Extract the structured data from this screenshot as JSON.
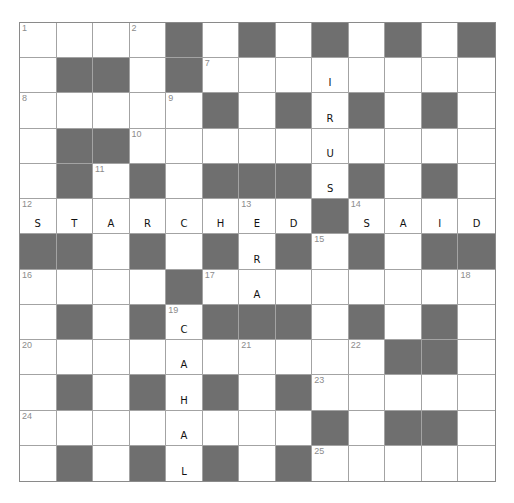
{
  "puzzle": {
    "rows": 13,
    "cols": 13,
    "colors": {
      "block": "#6f6f6f",
      "open": "#ffffff",
      "gridline": "#a3a3a3",
      "number": "#8c8c8c",
      "letter": "#111111"
    },
    "layout": [
      "....#.#.#.#.#",
      ".##.#........",
      ".....#.#.#.#.",
      ".##..........",
      ".#.#.###.#.#.",
      "........#....",
      "##.#.#.#.#.##",
      "....#........",
      ".#.#.###.#.#.",
      "..........##.",
      ".#.#.#.#.....",
      "........#.##.",
      ".#.#.#.#....."
    ],
    "numbers": [
      {
        "r": 0,
        "c": 0,
        "n": "1"
      },
      {
        "r": 0,
        "c": 3,
        "n": "2"
      },
      {
        "r": 0,
        "c": 6,
        "n": "3"
      },
      {
        "r": 0,
        "c": 8,
        "n": "4"
      },
      {
        "r": 0,
        "c": 10,
        "n": "5"
      },
      {
        "r": 0,
        "c": 12,
        "n": "6"
      },
      {
        "r": 1,
        "c": 5,
        "n": "7"
      },
      {
        "r": 2,
        "c": 0,
        "n": "8"
      },
      {
        "r": 2,
        "c": 4,
        "n": "9"
      },
      {
        "r": 3,
        "c": 3,
        "n": "10"
      },
      {
        "r": 4,
        "c": 2,
        "n": "11"
      },
      {
        "r": 5,
        "c": 0,
        "n": "12"
      },
      {
        "r": 5,
        "c": 6,
        "n": "13"
      },
      {
        "r": 5,
        "c": 9,
        "n": "14"
      },
      {
        "r": 6,
        "c": 8,
        "n": "15"
      },
      {
        "r": 7,
        "c": 0,
        "n": "16"
      },
      {
        "r": 7,
        "c": 5,
        "n": "17"
      },
      {
        "r": 7,
        "c": 12,
        "n": "18"
      },
      {
        "r": 8,
        "c": 4,
        "n": "19"
      },
      {
        "r": 9,
        "c": 0,
        "n": "20"
      },
      {
        "r": 9,
        "c": 6,
        "n": "21"
      },
      {
        "r": 9,
        "c": 9,
        "n": "22"
      },
      {
        "r": 10,
        "c": 8,
        "n": "23"
      },
      {
        "r": 11,
        "c": 0,
        "n": "24"
      },
      {
        "r": 12,
        "c": 8,
        "n": "25"
      }
    ],
    "entries": [
      {
        "r": 0,
        "c": 8,
        "ch": "V"
      },
      {
        "r": 1,
        "c": 8,
        "ch": "I"
      },
      {
        "r": 2,
        "c": 8,
        "ch": "R"
      },
      {
        "r": 3,
        "c": 8,
        "ch": "U"
      },
      {
        "r": 4,
        "c": 8,
        "ch": "S"
      },
      {
        "r": 5,
        "c": 0,
        "ch": "S"
      },
      {
        "r": 5,
        "c": 1,
        "ch": "T"
      },
      {
        "r": 5,
        "c": 2,
        "ch": "A"
      },
      {
        "r": 5,
        "c": 3,
        "ch": "R"
      },
      {
        "r": 5,
        "c": 4,
        "ch": "C"
      },
      {
        "r": 5,
        "c": 5,
        "ch": "H"
      },
      {
        "r": 5,
        "c": 6,
        "ch": "E"
      },
      {
        "r": 5,
        "c": 7,
        "ch": "D"
      },
      {
        "r": 5,
        "c": 9,
        "ch": "S"
      },
      {
        "r": 5,
        "c": 10,
        "ch": "A"
      },
      {
        "r": 5,
        "c": 11,
        "ch": "I"
      },
      {
        "r": 5,
        "c": 12,
        "ch": "D"
      },
      {
        "r": 6,
        "c": 6,
        "ch": "R"
      },
      {
        "r": 7,
        "c": 6,
        "ch": "A"
      },
      {
        "r": 8,
        "c": 4,
        "ch": "C"
      },
      {
        "r": 9,
        "c": 4,
        "ch": "A"
      },
      {
        "r": 10,
        "c": 4,
        "ch": "H"
      },
      {
        "r": 11,
        "c": 4,
        "ch": "A"
      },
      {
        "r": 12,
        "c": 4,
        "ch": "L"
      }
    ],
    "filled_words": {
      "4_down": "VIRUS",
      "12_across": "STARCHED",
      "14_across": "SAID",
      "13_down": "ERA",
      "19_down": "CAHAL"
    }
  }
}
